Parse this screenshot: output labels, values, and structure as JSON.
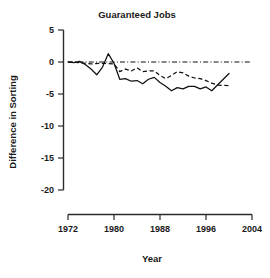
{
  "chart_data": {
    "type": "line",
    "title": "Guaranteed Jobs",
    "xlabel": "Year",
    "ylabel": "Difference in Sorting",
    "xlim": [
      1972,
      2004
    ],
    "ylim": [
      -20,
      5
    ],
    "xticks": [
      1972,
      1980,
      1988,
      1996,
      2004
    ],
    "yticks": [
      5,
      0,
      -5,
      -10,
      -15,
      -20
    ],
    "xtick_labels": [
      "1972",
      "1980",
      "1988",
      "1996",
      "2004"
    ],
    "ytick_labels": [
      "5",
      "0",
      "-5",
      "-10",
      "-15",
      "-20"
    ],
    "grid": false,
    "legend": "none",
    "line_color": "#111111",
    "axis_color": "#2b2b2b",
    "background": "#ffffff",
    "series": [
      {
        "name": "solid-series",
        "style": "solid",
        "x": [
          1972,
          1973,
          1974,
          1975,
          1976,
          1977,
          1978,
          1979,
          1980,
          1981,
          1982,
          1983,
          1984,
          1985,
          1986,
          1987,
          1988,
          1989,
          1990,
          1991,
          1992,
          1993,
          1994,
          1995,
          1996,
          1997,
          1998,
          1999,
          2000
        ],
        "values": [
          0.0,
          -0.1,
          0.1,
          -0.4,
          -1.1,
          -2.0,
          -0.8,
          1.3,
          -0.2,
          -2.7,
          -2.6,
          -3.0,
          -2.9,
          -3.4,
          -2.7,
          -2.4,
          -3.2,
          -3.8,
          -4.5,
          -4.0,
          -4.2,
          -3.8,
          -3.8,
          -4.2,
          -3.9,
          -4.5,
          -3.6,
          -2.7,
          -1.8
        ]
      },
      {
        "name": "dashed-series",
        "style": "dashed",
        "x": [
          1972,
          1974,
          1976,
          1978,
          1980,
          1981,
          1982,
          1983,
          1984,
          1985,
          1986,
          1987,
          1988,
          1989,
          1990,
          1991,
          1992,
          1993,
          1994,
          1995,
          1996,
          1997,
          1998,
          2000
        ],
        "values": [
          0.0,
          -0.1,
          -0.3,
          -0.2,
          -0.3,
          -1.5,
          -1.1,
          -1.4,
          -0.9,
          -1.5,
          -1.4,
          -1.4,
          -2.1,
          -2.6,
          -2.1,
          -1.5,
          -1.7,
          -2.2,
          -2.5,
          -2.6,
          -2.9,
          -3.3,
          -3.6,
          -3.7
        ]
      },
      {
        "name": "reference-zero-line",
        "style": "dashdot",
        "x": [
          1972,
          2004
        ],
        "values": [
          0.0,
          0.0
        ]
      }
    ]
  }
}
